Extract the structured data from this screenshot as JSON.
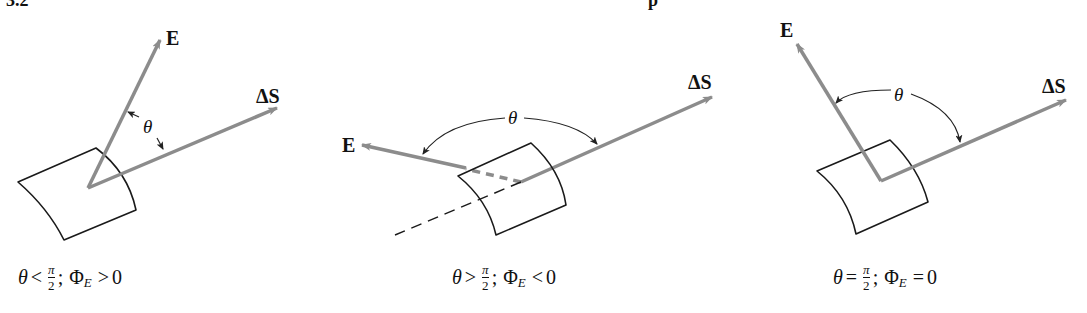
{
  "header": {
    "section_number": "3.2",
    "fragment": "p"
  },
  "colors": {
    "vector": "#8c8c8c",
    "surface": "#1a1a1a",
    "annotation": "#222222",
    "background": "#ffffff"
  },
  "diagrams": [
    {
      "id": "acute",
      "e_label": "E",
      "s_label": "ΔS",
      "angle_label": "θ",
      "caption": {
        "lhs": "θ",
        "relation": "<",
        "frac_num": "π",
        "frac_den": "2",
        "sep": ";",
        "flux": "Φ",
        "flux_sub": "E",
        "flux_rel": ">",
        "flux_val": "0"
      }
    },
    {
      "id": "obtuse",
      "e_label": "E",
      "s_label": "ΔS",
      "angle_label": "θ",
      "caption": {
        "lhs": "θ",
        "relation": ">",
        "frac_num": "π",
        "frac_den": "2",
        "sep": ";",
        "flux": "Φ",
        "flux_sub": "E",
        "flux_rel": "<",
        "flux_val": "0"
      }
    },
    {
      "id": "right",
      "e_label": "E",
      "s_label": "ΔS",
      "angle_label": "θ",
      "caption": {
        "lhs": "θ",
        "relation": "=",
        "frac_num": "π",
        "frac_den": "2",
        "sep": ";",
        "flux": "Φ",
        "flux_sub": "E",
        "flux_rel": "=",
        "flux_val": "0"
      }
    }
  ]
}
